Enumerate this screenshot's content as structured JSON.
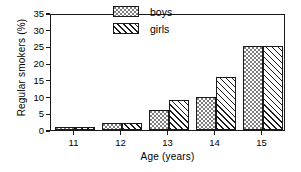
{
  "chart_data": {
    "type": "bar",
    "title": "",
    "xlabel": "Age (years)",
    "ylabel": "Regular smokers (%)",
    "categories": [
      "11",
      "12",
      "13",
      "14",
      "15"
    ],
    "series": [
      {
        "name": "boys",
        "values": [
          1,
          2,
          6,
          10,
          25
        ],
        "pattern": "dotted"
      },
      {
        "name": "girls",
        "values": [
          1,
          2,
          9,
          16,
          25
        ],
        "pattern": "diagonal-hatch"
      }
    ],
    "ylim": [
      0,
      35
    ],
    "yticks": [
      0,
      5,
      10,
      15,
      20,
      25,
      30,
      35
    ],
    "ytick_labels": [
      "0",
      "5",
      "10",
      "15",
      "20",
      "25",
      "30",
      "35"
    ],
    "grid": false,
    "legend_position": "top-center",
    "frame": true,
    "colors": {
      "line": "#1a1a1a",
      "background": "#ffffff"
    }
  },
  "legend": {
    "entries": [
      {
        "label": "boys"
      },
      {
        "label": "girls"
      }
    ]
  }
}
